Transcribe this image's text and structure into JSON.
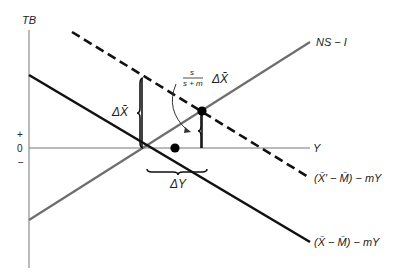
{
  "diagram": {
    "type": "economics-graph",
    "axes": {
      "y_label": "TB",
      "x_label": "Y",
      "plus_sign": "+",
      "zero": "0",
      "minus_sign": "−"
    },
    "lines": {
      "ns_i": {
        "label": "NS − I",
        "color": "#6e6e6e",
        "style": "solid"
      },
      "tb_new": {
        "label_prefix": "(",
        "label_body": "X′ − M) − mY",
        "label": "(X̄′ − M̄) − mY",
        "color": "#111111",
        "style": "dashed"
      },
      "tb_old": {
        "label": "(X̄ − M̄) − mY",
        "color": "#111111",
        "style": "solid"
      }
    },
    "annotations": {
      "delta_x": "ΔX̄",
      "delta_x_part": "X̄",
      "delta_symbol": "Δ",
      "fraction_num": "s",
      "fraction_den": "s + m",
      "fraction_suffix": "ΔX̄",
      "delta_y": "ΔY"
    },
    "points": [
      {
        "name": "original-equilibrium",
        "x": 175,
        "y": 148
      },
      {
        "name": "new-equilibrium",
        "x": 202,
        "y": 110
      }
    ]
  }
}
